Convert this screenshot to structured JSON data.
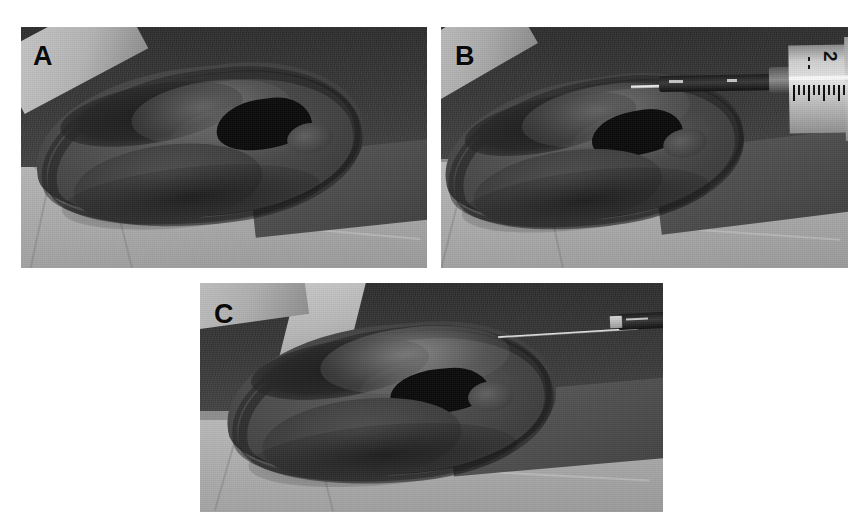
{
  "figure": {
    "type": "clinical-photograph-multipanel",
    "background_color": "#ffffff",
    "panel_count": 3,
    "layout": "two panels on top row, one centered panel on bottom row"
  },
  "panels": [
    {
      "id": "A",
      "letter": "A",
      "caption_letter_color": "#0a0a0a",
      "description": "Auricle with fluctuant auricular hematoma over the antihelix and scapha, no instrument present",
      "rect": {
        "x": 21,
        "y": 27,
        "width": 406,
        "height": 241
      },
      "has_syringe": false,
      "has_needle": false,
      "tones": {
        "drape": "#b2b2b2",
        "hair_scalp": "#343434",
        "ear_cartilage": "#4a4a4a",
        "concha_shadow": "#0c0c0c"
      }
    },
    {
      "id": "B",
      "letter": "B",
      "caption_letter_color": "#0a0a0a",
      "description": "Needle on syringe inserted into the hematoma for aspiration; syringe barrel graduations visible at right",
      "rect": {
        "x": 441,
        "y": 27,
        "width": 407,
        "height": 241
      },
      "has_syringe": true,
      "has_needle": true,
      "syringe": {
        "barrel_label": "2",
        "barrel_label_units": "mL",
        "graduation_count": 11,
        "needle_orientation": "horizontal, entering from the right",
        "barrel_color": "#d8d8d8",
        "hub_color": "#1a1a1a"
      },
      "tones": {
        "drape": "#b2b2b2",
        "hair_scalp": "#343434",
        "ear_cartilage": "#4a4a4a",
        "concha_shadow": "#0c0c0c"
      }
    },
    {
      "id": "C",
      "letter": "C",
      "caption_letter_color": "#0a0a0a",
      "description": "Needle alone after aspiration; decompressed auricle with flattened hematoma bulge",
      "rect": {
        "x": 200,
        "y": 283,
        "width": 463,
        "height": 229
      },
      "has_syringe": false,
      "has_needle": true,
      "needle": {
        "orientation": "horizontal, entering from the right",
        "shaft_color": "#e8e8e8",
        "hub_color": "#151515"
      },
      "tones": {
        "drape": "#b2b2b2",
        "hair_scalp": "#3a3a3a",
        "ear_cartilage": "#4e4e4e",
        "concha_shadow": "#101010"
      }
    }
  ]
}
